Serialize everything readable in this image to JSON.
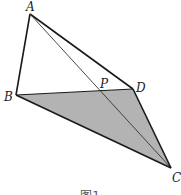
{
  "diagram": {
    "type": "geometry-figure",
    "points": {
      "A": {
        "label": "A",
        "x": 30,
        "y": 14
      },
      "B": {
        "label": "B",
        "x": 16,
        "y": 95
      },
      "C": {
        "label": "C",
        "x": 171,
        "y": 168
      },
      "D": {
        "label": "D",
        "x": 133,
        "y": 89
      },
      "P": {
        "label": "P",
        "x": 104,
        "y": 91
      }
    },
    "edges": [
      {
        "from": "A",
        "to": "B",
        "style": "solid"
      },
      {
        "from": "A",
        "to": "D",
        "style": "solid"
      },
      {
        "from": "A",
        "to": "C",
        "style": "thin"
      },
      {
        "from": "B",
        "to": "D",
        "style": "solid"
      },
      {
        "from": "B",
        "to": "C",
        "style": "solid"
      },
      {
        "from": "D",
        "to": "C",
        "style": "solid"
      }
    ],
    "shaded_region": {
      "vertices": [
        "B",
        "D",
        "C"
      ],
      "color": "#b3b3b3"
    },
    "line_color": "#1a1a1a",
    "caption": "图1"
  }
}
